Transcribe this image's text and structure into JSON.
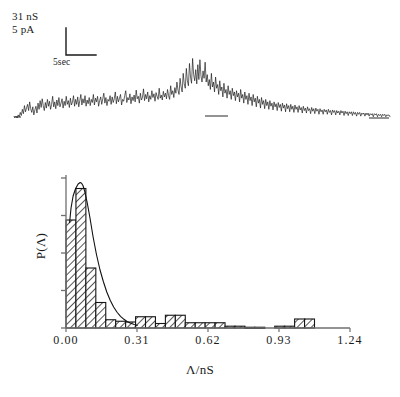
{
  "figure": {
    "panel_a": {
      "name": "single-channel-current-trace",
      "scale_vertical_conductance": "31 nS",
      "scale_vertical_current": "5 pA",
      "scale_horizontal_time": "5sec"
    },
    "panel_b": {
      "name": "conductance-amplitude-histogram",
      "ylabel": "P(Λ)",
      "xlabel": "Λ/nS",
      "xticks": [
        "0.00",
        "0.31",
        "0.62",
        "0.93",
        "1.24"
      ]
    }
  },
  "chart_data": [
    {
      "type": "line",
      "name": "current-trace",
      "title": "",
      "xlabel": "time",
      "ylabel": "current",
      "annotations": [
        "31 nS",
        "5 pA",
        "5sec"
      ],
      "scalebar": {
        "vertical": "5 pA / 31 nS",
        "horizontal": "5sec"
      },
      "grid": false,
      "legend": "none",
      "x": [
        0,
        1,
        2,
        3,
        4,
        5,
        6,
        7,
        8,
        9,
        10,
        11,
        12,
        13,
        14,
        15,
        16,
        17,
        18,
        19,
        20,
        21,
        22,
        23,
        24,
        25,
        26,
        27,
        28,
        29,
        30,
        31,
        32,
        33,
        34,
        35,
        36,
        37,
        38,
        39,
        40,
        41,
        42,
        43,
        44,
        45,
        46,
        47,
        48,
        49,
        50,
        51,
        52,
        53,
        54,
        55,
        56,
        57,
        58,
        59,
        60,
        61,
        62,
        63,
        64,
        65,
        66,
        67,
        68,
        69,
        70,
        71,
        72,
        73,
        74,
        75,
        76,
        77,
        78,
        79,
        80,
        81,
        82,
        83,
        84,
        85,
        86,
        87,
        88,
        89,
        90,
        91,
        92,
        93,
        94,
        95,
        96,
        97,
        98,
        99,
        100,
        101,
        102,
        103,
        104,
        105,
        106,
        107,
        108,
        109,
        110,
        111,
        112,
        113,
        114,
        115,
        116,
        117,
        118,
        119,
        120,
        121,
        122,
        123,
        124,
        125,
        126,
        127,
        128,
        129,
        130,
        131,
        132,
        133,
        134,
        135,
        136,
        137,
        138,
        139,
        140,
        141,
        142,
        143,
        144,
        145,
        146,
        147,
        148,
        149,
        150,
        151,
        152,
        153,
        154,
        155,
        156,
        157,
        158,
        159,
        160,
        161,
        162,
        163,
        164,
        165,
        166,
        167,
        168,
        169,
        170,
        171,
        172,
        173,
        174,
        175,
        176,
        177,
        178,
        179,
        180,
        181,
        182,
        183,
        184,
        185,
        186,
        187,
        188,
        189,
        190,
        191,
        192,
        193,
        194,
        195,
        196,
        197,
        198,
        199,
        200,
        201,
        202,
        203,
        204,
        205,
        206,
        207,
        208,
        209,
        210,
        211,
        212,
        213,
        214,
        215,
        216,
        217,
        218,
        219,
        220,
        221,
        222,
        223,
        224,
        225,
        226,
        227,
        228,
        229,
        230,
        231,
        232,
        233,
        234,
        235,
        236,
        237,
        238,
        239,
        240,
        241,
        242,
        243,
        244,
        245,
        246,
        247,
        248,
        249,
        250,
        251,
        252,
        253,
        254,
        255,
        256,
        257,
        258,
        259,
        260,
        261,
        262,
        263,
        264,
        265,
        266,
        267,
        268,
        269,
        270,
        271,
        272,
        273,
        274,
        275,
        276,
        277,
        278,
        279,
        280,
        281,
        282,
        283,
        284,
        285,
        286,
        287,
        288,
        289,
        290,
        291,
        292,
        293,
        294,
        295,
        296,
        297,
        298,
        299,
        300,
        301,
        302,
        303,
        304,
        305,
        306,
        307,
        308,
        309,
        310,
        311,
        312,
        313,
        314,
        315,
        316,
        317,
        318,
        319,
        320,
        321,
        322,
        323,
        324,
        325,
        326,
        327,
        328,
        329,
        330,
        331,
        332,
        333,
        334,
        335,
        336,
        337,
        338,
        339,
        340,
        341,
        342,
        343,
        344,
        345,
        346,
        347,
        348,
        349,
        350,
        351,
        352,
        353,
        354,
        355,
        356,
        357,
        358,
        359
      ],
      "y": [
        2,
        1,
        3,
        0,
        5,
        2,
        9,
        4,
        14,
        7,
        20,
        10,
        16,
        22,
        12,
        26,
        15,
        9,
        18,
        5,
        13,
        19,
        8,
        24,
        14,
        28,
        17,
        31,
        20,
        12,
        25,
        16,
        30,
        19,
        27,
        14,
        22,
        35,
        18,
        26,
        15,
        29,
        20,
        33,
        18,
        24,
        31,
        16,
        27,
        20,
        35,
        22,
        28,
        17,
        32,
        21,
        26,
        36,
        19,
        30,
        22,
        34,
        18,
        28,
        38,
        21,
        31,
        24,
        36,
        19,
        29,
        23,
        33,
        20,
        30,
        25,
        38,
        21,
        32,
        26,
        35,
        19,
        28,
        34,
        22,
        31,
        40,
        24,
        33,
        20,
        30,
        27,
        36,
        22,
        34,
        25,
        31,
        42,
        23,
        35,
        26,
        32,
        38,
        21,
        30,
        27,
        36,
        44,
        25,
        33,
        29,
        39,
        23,
        34,
        28,
        37,
        26,
        45,
        31,
        35,
        24,
        40,
        29,
        33,
        47,
        28,
        38,
        31,
        42,
        26,
        36,
        30,
        44,
        33,
        39,
        27,
        41,
        35,
        30,
        48,
        32,
        37,
        29,
        43,
        34,
        40,
        31,
        46,
        36,
        30,
        52,
        38,
        44,
        33,
        49,
        40,
        58,
        45,
        38,
        64,
        50,
        42,
        72,
        55,
        48,
        80,
        60,
        52,
        88,
        66,
        56,
        96,
        70,
        60,
        78,
        55,
        86,
        62,
        94,
        68,
        58,
        76,
        64,
        90,
        58,
        70,
        52,
        62,
        46,
        72,
        50,
        58,
        42,
        66,
        48,
        54,
        38,
        60,
        44,
        50,
        34,
        56,
        40,
        46,
        32,
        52,
        38,
        44,
        30,
        48,
        36,
        42,
        28,
        44,
        34,
        40,
        26,
        46,
        32,
        38,
        24,
        42,
        30,
        36,
        22,
        40,
        28,
        34,
        20,
        38,
        26,
        32,
        18,
        35,
        24,
        30,
        16,
        33,
        22,
        28,
        15,
        30,
        20,
        26,
        14,
        28,
        19,
        24,
        13,
        26,
        18,
        23,
        12,
        25,
        17,
        22,
        11,
        24,
        16,
        21,
        10,
        23,
        15,
        20,
        10,
        22,
        14,
        19,
        9,
        21,
        14,
        18,
        9,
        20,
        13,
        17,
        8,
        19,
        12,
        16,
        8,
        18,
        12,
        15,
        7,
        17,
        11,
        15,
        7,
        16,
        11,
        14,
        6,
        15,
        10,
        13,
        6,
        14,
        10,
        13,
        6,
        14,
        9,
        12,
        5,
        13,
        9,
        12,
        5,
        12,
        8,
        11,
        5,
        12,
        8,
        11,
        4,
        11,
        7,
        10,
        4,
        10,
        7,
        10,
        4,
        10,
        6,
        9,
        3,
        9,
        6,
        9,
        3,
        8,
        6,
        8,
        3,
        8,
        5,
        8,
        3,
        7,
        5,
        7,
        2,
        7,
        5,
        7,
        2,
        6,
        4,
        6,
        2,
        6,
        4,
        6,
        2,
        5,
        4,
        5,
        2
      ]
    },
    {
      "type": "bar",
      "name": "conductance-histogram",
      "title": "",
      "xlabel": "Λ/nS",
      "ylabel": "P(Λ)",
      "xlim": [
        0.0,
        1.24
      ],
      "ylim": [
        0.0,
        1.0
      ],
      "xticks": [
        0.0,
        0.31,
        0.62,
        0.93,
        1.24
      ],
      "xticklabels": [
        "0.00",
        "0.31",
        "0.62",
        "0.93",
        "1.24"
      ],
      "ytick_count": 5,
      "yticklabels": [],
      "grid": false,
      "legend": "none",
      "bin_width": 0.0434,
      "bin_centers": [
        0.0217,
        0.0651,
        0.1085,
        0.1519,
        0.1953,
        0.2387,
        0.2821,
        0.3255,
        0.3689,
        0.4123,
        0.4557,
        0.4991,
        0.5425,
        0.5859,
        0.6293,
        0.6727,
        0.7161,
        0.7595,
        0.8029,
        0.8463,
        0.8897,
        0.9331,
        0.9765,
        1.0199,
        1.0633,
        1.1067
      ],
      "values": [
        0.72,
        0.93,
        0.4,
        0.17,
        0.055,
        0.045,
        0.04,
        0.075,
        0.075,
        0.03,
        0.085,
        0.085,
        0.035,
        0.035,
        0.035,
        0.035,
        0.012,
        0.012,
        0.005,
        0.005,
        0.0,
        0.012,
        0.012,
        0.06,
        0.06,
        0.0
      ],
      "fit_curve": {
        "name": "gamma-fit",
        "x": [
          0.0155,
          0.022,
          0.031,
          0.042,
          0.053,
          0.062,
          0.068,
          0.074,
          0.082,
          0.092,
          0.104,
          0.118,
          0.133,
          0.148,
          0.163,
          0.178,
          0.193,
          0.208,
          0.223,
          0.238,
          0.253,
          0.268,
          0.283,
          0.298,
          0.313
        ],
        "y": [
          0.7,
          0.8,
          0.88,
          0.93,
          0.96,
          0.97,
          0.965,
          0.95,
          0.91,
          0.84,
          0.74,
          0.61,
          0.49,
          0.39,
          0.31,
          0.24,
          0.185,
          0.14,
          0.105,
          0.078,
          0.058,
          0.042,
          0.031,
          0.023,
          0.017
        ]
      }
    }
  ]
}
